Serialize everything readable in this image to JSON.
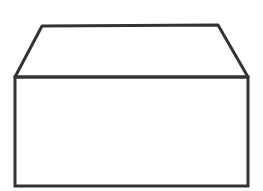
{
  "diagram": {
    "stroke_color": "#333333",
    "background": "#ffffff",
    "stroke_width": 3,
    "lid": {
      "points": "42,26 218,25 248,77 15,77"
    },
    "body": {
      "x": 15,
      "y": 77,
      "width": 233,
      "height": 109
    }
  }
}
